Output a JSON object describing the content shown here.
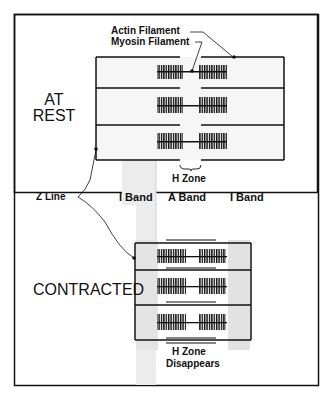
{
  "diagram": {
    "labels": {
      "actin": "Actin Filament",
      "myosin": "Myosin Filament",
      "at_rest_line1": "AT",
      "at_rest_line2": "REST",
      "h_zone": "H Zone",
      "z_line": "Z Line",
      "i_band_left": "I Band",
      "a_band": "A Band",
      "i_band_right": "I Band",
      "contracted": "CONTRACTED",
      "h_zone_disappears_line1": "H Zone",
      "h_zone_disappears_line2": "Disappears"
    },
    "colors": {
      "line": "#111111",
      "shade": "#d9d9d9",
      "background": "#ffffff"
    }
  }
}
